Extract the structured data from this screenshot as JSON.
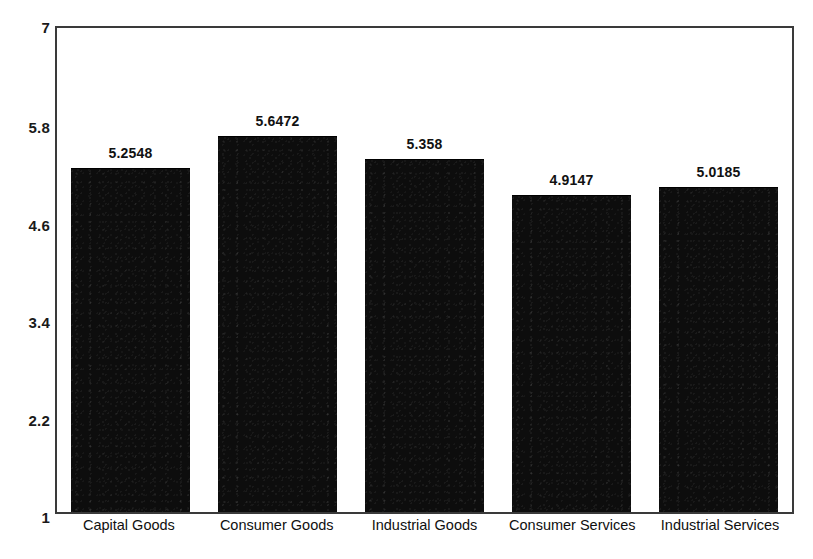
{
  "chart_data": {
    "type": "bar",
    "title": "",
    "subtitle": "",
    "xlabel": "",
    "ylabel": "",
    "categories": [
      "Capital Goods",
      "Consumer Goods",
      "Industrial Goods",
      "Consumer Services",
      "Industrial Services"
    ],
    "values": [
      5.2548,
      5.6472,
      5.358,
      4.9147,
      5.0185
    ],
    "value_labels": [
      "5.2548",
      "5.6472",
      "5.358",
      "4.9147",
      "5.0185"
    ],
    "ylim": [
      1,
      7
    ],
    "yticks": [
      1,
      2.2,
      3.4,
      4.6,
      5.8,
      7
    ],
    "ytick_labels": [
      "1",
      "2.2",
      "3.4",
      "4.6",
      "5.8",
      "7"
    ],
    "grid": false,
    "legend": null,
    "legend_position": "none",
    "bar_color": "#0d0d0d",
    "frame_color": "#3a3a3a",
    "background_color": "#ffffff"
  }
}
